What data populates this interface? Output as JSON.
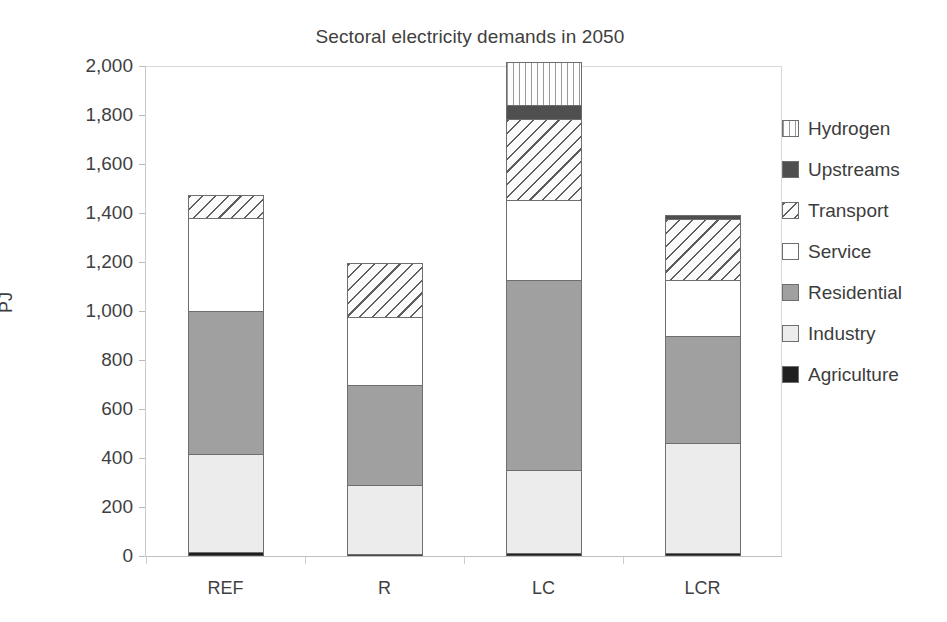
{
  "chart_data": {
    "type": "bar",
    "subtype": "stacked-column",
    "title": "Sectoral electricity demands in 2050",
    "xlabel": "",
    "ylabel": "PJ",
    "ylim": [
      0,
      2000
    ],
    "ytick_step": 200,
    "grid": false,
    "legend_position": "right",
    "categories": [
      "REF",
      "R",
      "LC",
      "LCR"
    ],
    "ytick_labels": [
      "2,000",
      "1,800",
      "1,600",
      "1,400",
      "1,200",
      "1,000",
      "800",
      "600",
      "400",
      "200",
      "0"
    ],
    "ytick_values": [
      2000,
      1800,
      1600,
      1400,
      1200,
      1000,
      800,
      600,
      400,
      200,
      0
    ],
    "series": [
      {
        "name": "Agriculture",
        "values": [
          15,
          10,
          12,
          12
        ],
        "fill": "solid-black",
        "color": "#1f1f1f"
      },
      {
        "name": "Industry",
        "values": [
          400,
          280,
          338,
          448
        ],
        "fill": "solid-light-gray",
        "color": "#ececec"
      },
      {
        "name": "Residential",
        "values": [
          585,
          410,
          775,
          440
        ],
        "fill": "solid-medium-gray",
        "color": "#a0a0a0"
      },
      {
        "name": "Service",
        "values": [
          380,
          275,
          330,
          225
        ],
        "fill": "solid-white",
        "color": "#ffffff"
      },
      {
        "name": "Transport",
        "values": [
          95,
          220,
          330,
          250
        ],
        "fill": "diagonal-hatch",
        "color": "#5e5e5e"
      },
      {
        "name": "Upstreams",
        "values": [
          0,
          0,
          55,
          15
        ],
        "fill": "solid-dark-gray",
        "color": "#4f4f4f"
      },
      {
        "name": "Hydrogen",
        "values": [
          0,
          0,
          175,
          0
        ],
        "fill": "vertical-stripes",
        "color": "#9a9a9a"
      }
    ],
    "totals": [
      1475,
      1195,
      1855,
      1390
    ]
  },
  "legend": {
    "items": [
      {
        "label": "Hydrogen",
        "fill": "vertical-stripes"
      },
      {
        "label": "Upstreams",
        "fill": "solid-dark-gray"
      },
      {
        "label": "Transport",
        "fill": "diagonal-hatch"
      },
      {
        "label": "Service",
        "fill": "solid-white"
      },
      {
        "label": "Residential",
        "fill": "solid-medium-gray"
      },
      {
        "label": "Industry",
        "fill": "solid-light-gray"
      },
      {
        "label": "Agriculture",
        "fill": "solid-black"
      }
    ]
  }
}
